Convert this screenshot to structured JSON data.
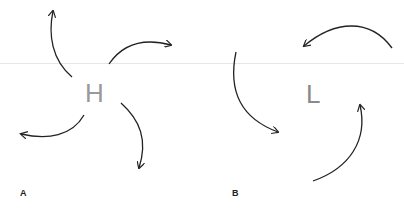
{
  "diagram": {
    "type": "atmospheric pressure circulation",
    "panels": [
      {
        "label": "A",
        "center_symbol": "H",
        "meaning": "high pressure",
        "flow": "outward, clockwise-curving arrows",
        "arrow_count": 4
      },
      {
        "label": "B",
        "center_symbol": "L",
        "meaning": "low pressure",
        "flow": "inward, curving arrows",
        "arrow_count": 3
      }
    ]
  },
  "colors": {
    "letter": "#9a9a9a",
    "arrow": "#222222",
    "label": "#222222",
    "background": "#ffffff"
  }
}
